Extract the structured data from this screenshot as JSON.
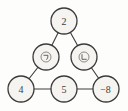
{
  "diagram": {
    "type": "magic-triangle-number-puzzle",
    "background": "#fdfdfc",
    "colors": {
      "circle_fill": "#f5f4f1",
      "circle_stroke": "#3a3a3a",
      "edge_stroke": "#3c3c3c",
      "text": "#3d3d3d",
      "placeholder_stroke": "#6e6e6e"
    },
    "nodes": [
      {
        "id": "top",
        "label": "2",
        "kind": "value"
      },
      {
        "id": "middle-left",
        "label": "",
        "kind": "placeholder",
        "icon": "circled-giyeok-icon"
      },
      {
        "id": "middle-right",
        "label": "",
        "kind": "placeholder",
        "icon": "circled-nieun-icon"
      },
      {
        "id": "bottom-left",
        "label": "4",
        "kind": "value"
      },
      {
        "id": "bottom-center",
        "label": "5",
        "kind": "value"
      },
      {
        "id": "bottom-right",
        "label": "−8",
        "kind": "value"
      }
    ],
    "edges": [
      {
        "from": "top",
        "to": "middle-left"
      },
      {
        "from": "top",
        "to": "middle-right"
      },
      {
        "from": "middle-left",
        "to": "bottom-left"
      },
      {
        "from": "middle-right",
        "to": "bottom-right"
      },
      {
        "from": "bottom-left",
        "to": "bottom-center"
      },
      {
        "from": "bottom-center",
        "to": "bottom-right"
      }
    ]
  }
}
